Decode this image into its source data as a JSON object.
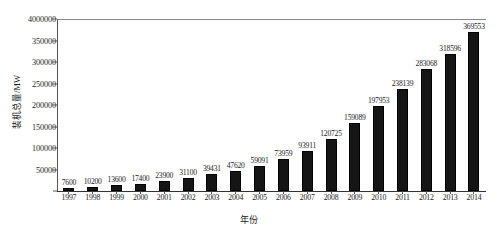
{
  "chart_data": {
    "type": "bar",
    "title": "",
    "xlabel": "年份",
    "ylabel": "装机总量/MW",
    "categories": [
      "1997",
      "1998",
      "1999",
      "2000",
      "2001",
      "2002",
      "2003",
      "2004",
      "2005",
      "2006",
      "2007",
      "2008",
      "2009",
      "2010",
      "2011",
      "2012",
      "2013",
      "2014"
    ],
    "values": [
      7600,
      10200,
      13600,
      17400,
      23900,
      31100,
      39431,
      47620,
      59091,
      73959,
      93911,
      120725,
      159089,
      197953,
      238139,
      283068,
      318596,
      369553
    ],
    "value_labels": [
      "7600",
      "10200",
      "13600",
      "17400",
      "23900",
      "31100",
      "39431",
      "47620",
      "59091",
      "73959",
      "93911",
      "120725",
      "159089",
      "197953",
      "238139",
      "283068",
      "318596",
      "369553"
    ],
    "ylim": [
      0,
      400000
    ],
    "ytick_values": [
      400000,
      350000,
      300000,
      250000,
      200000,
      150000,
      100000,
      50000,
      0
    ],
    "ytick_labels": [
      "4000000",
      "350000",
      "300000",
      "250000",
      "200000",
      "150000",
      "100000",
      "50000",
      ""
    ],
    "grid": false,
    "legend": null,
    "bar_color": "#151515",
    "axis_color": "#555555",
    "text_color": "#1a1a1a"
  }
}
